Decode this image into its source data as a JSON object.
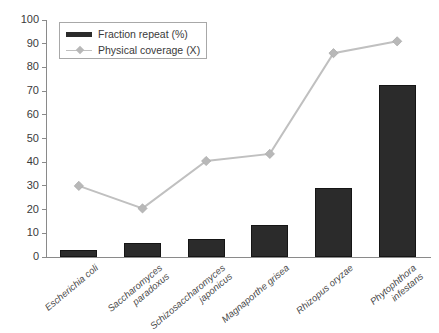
{
  "chart_data": {
    "type": "bar",
    "title": "",
    "subtitle": "",
    "xlabel": "",
    "ylabel": "",
    "ylim": [
      0,
      100
    ],
    "yticks": [
      0,
      10,
      20,
      30,
      40,
      50,
      60,
      70,
      80,
      90,
      100
    ],
    "grid": false,
    "legend_position": "top-left",
    "categories": [
      "Escherichia coli",
      "Saccharomyces paradoxus",
      "Schizosaccharomyces japonicus",
      "Magnaporthe grisea",
      "Rhizopus oryzae",
      "Phytophthora infestans"
    ],
    "category_lines": [
      [
        "Escherichia coli"
      ],
      [
        "Saccharomyces",
        "paradoxus"
      ],
      [
        "Schizosaccharomyces",
        "japonicus"
      ],
      [
        "Magnaporthe grisea"
      ],
      [
        "Rhizopus oryzae"
      ],
      [
        "Phytophthora",
        "infestans"
      ]
    ],
    "series": [
      {
        "name": "Fraction repeat (%)",
        "type": "bar",
        "color": "#2b2b2b",
        "values": [
          3,
          6,
          7.5,
          13.5,
          29,
          72.5
        ]
      },
      {
        "name": "Physical coverage (X)",
        "type": "line",
        "color": "#c0c0c0",
        "marker": "diamond",
        "values": [
          30,
          20.5,
          40.5,
          43.5,
          86,
          91
        ]
      }
    ]
  },
  "legend": {
    "items": [
      {
        "label": "Fraction repeat (%)",
        "key": "bar-swatch"
      },
      {
        "label": "Physical coverage (X)",
        "key": "line-marker-swatch"
      }
    ]
  },
  "axes": {
    "y": {
      "ticks": [
        "0",
        "10",
        "20",
        "30",
        "40",
        "50",
        "60",
        "70",
        "80",
        "90",
        "100"
      ]
    }
  },
  "colors": {
    "bar": "#2b2b2b",
    "line": "#c0c0c0",
    "marker": "#b8b8b8",
    "axis": "#8a8a8a",
    "text": "#3a3a3a",
    "background": "#ffffff"
  }
}
